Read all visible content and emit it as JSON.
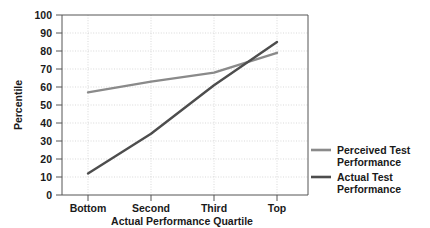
{
  "chart_data": {
    "type": "line",
    "title": "",
    "xlabel": "Actual Performance Quartile",
    "ylabel": "Percentile",
    "categories": [
      "Bottom",
      "Second",
      "Third",
      "Top"
    ],
    "ylim": [
      0,
      100
    ],
    "yticks": [
      0,
      10,
      20,
      30,
      40,
      50,
      60,
      70,
      80,
      90,
      100
    ],
    "ytick_labels": [
      "0",
      "10",
      "20",
      "30",
      "40",
      "50",
      "60",
      "70",
      "80",
      "90",
      "100"
    ],
    "grid": true,
    "legend_position": "right",
    "series": [
      {
        "name": "Perceived Test Performance",
        "values": [
          57,
          63,
          68,
          79
        ],
        "color": "#8a8a8a"
      },
      {
        "name": "Actual Test Performance",
        "values": [
          12,
          34,
          61,
          85
        ],
        "color": "#4d4d4d"
      }
    ]
  },
  "axes": {
    "ylabel": "Percentile",
    "xlabel": "Actual Performance Quartile",
    "ytick_labels": [
      "100",
      "90",
      "80",
      "70",
      "60",
      "50",
      "40",
      "30",
      "20",
      "10",
      "0"
    ],
    "xtick_labels": [
      "Bottom",
      "Second",
      "Third",
      "Top"
    ]
  },
  "legend": {
    "items": [
      {
        "line1": "Perceived Test",
        "line2": "Performance",
        "color": "#8a8a8a"
      },
      {
        "line1": "Actual Test",
        "line2": "Performance",
        "color": "#4d4d4d"
      }
    ]
  },
  "colors": {
    "perceived": "#8a8a8a",
    "actual": "#4d4d4d",
    "axis": "#555555",
    "grid": "#c8c8c8",
    "text": "#1a1a1a",
    "background": "#ffffff"
  }
}
